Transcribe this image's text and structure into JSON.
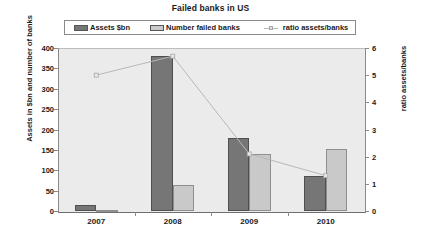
{
  "chart_data": {
    "type": "bar",
    "title": "Failed banks in US",
    "xlabel": "",
    "ylabel": "Assets in $bn and number of banks",
    "y2label": "ratio assets/banks",
    "categories": [
      "2007",
      "2008",
      "2009",
      "2010"
    ],
    "ylim": [
      0,
      400
    ],
    "yticks": [
      0,
      50,
      100,
      150,
      200,
      250,
      300,
      350,
      400
    ],
    "y2lim": [
      0,
      6
    ],
    "y2ticks": [
      0,
      1,
      2,
      3,
      4,
      5,
      6
    ],
    "grid": false,
    "legend_position": "top",
    "series": [
      {
        "name": "Assets $bn",
        "type": "bar",
        "axis": "left",
        "color": "#767676",
        "values": [
          15,
          380,
          179,
          86
        ]
      },
      {
        "name": "Number failed banks",
        "type": "bar",
        "axis": "left",
        "color": "#c9c9c9",
        "values": [
          3,
          64,
          140,
          152
        ]
      },
      {
        "name": "ratio assets/banks",
        "type": "line",
        "axis": "right",
        "color": "#b8b8b8",
        "values": [
          5.0,
          5.7,
          2.1,
          1.3
        ]
      }
    ]
  },
  "legend": {
    "items": [
      {
        "label": "Assets $bn"
      },
      {
        "label": "Number failed banks"
      },
      {
        "label": "ratio assets/banks"
      }
    ]
  }
}
